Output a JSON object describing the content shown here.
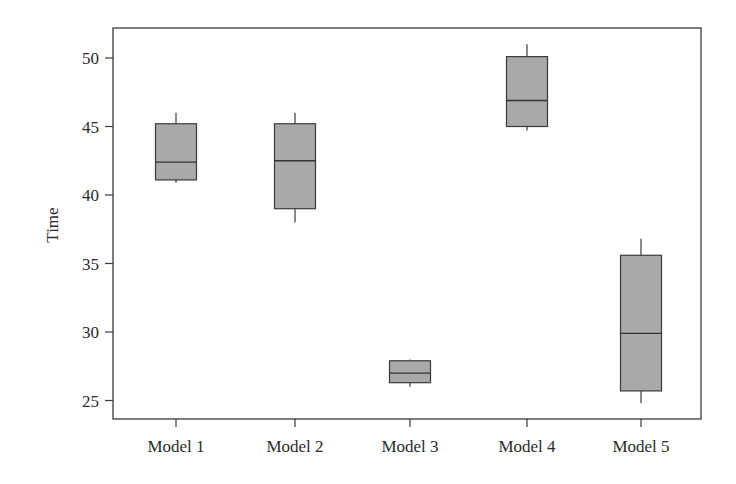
{
  "chart_data": {
    "type": "boxplot",
    "title": "",
    "xlabel": "",
    "ylabel": "Time",
    "ylim": [
      23.6,
      52.2
    ],
    "yticks": [
      25,
      30,
      35,
      40,
      45,
      50
    ],
    "grid": false,
    "legend": null,
    "box_fill": "#a9a9a9",
    "categories": [
      "Model 1",
      "Model 2",
      "Model 3",
      "Model 4",
      "Model 5"
    ],
    "series": [
      {
        "name": "Model 1",
        "whisker_low": 40.9,
        "q1": 41.1,
        "median": 42.4,
        "q3": 45.2,
        "whisker_high": 46.0
      },
      {
        "name": "Model 2",
        "whisker_low": 38.0,
        "q1": 39.0,
        "median": 42.5,
        "q3": 45.2,
        "whisker_high": 46.0
      },
      {
        "name": "Model 3",
        "whisker_low": 26.0,
        "q1": 26.3,
        "median": 27.0,
        "q3": 27.9,
        "whisker_high": 28.0
      },
      {
        "name": "Model 4",
        "whisker_low": 44.7,
        "q1": 45.0,
        "median": 46.9,
        "q3": 50.1,
        "whisker_high": 51.0
      },
      {
        "name": "Model 5",
        "whisker_low": 24.8,
        "q1": 25.7,
        "median": 29.9,
        "q3": 35.6,
        "whisker_high": 36.8
      }
    ]
  }
}
